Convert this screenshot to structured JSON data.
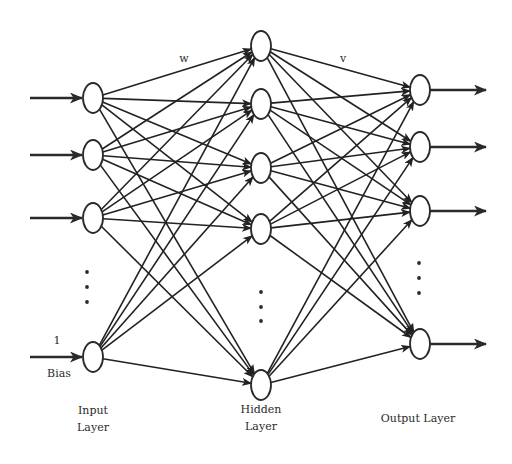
{
  "diagram": {
    "type": "feedforward-neural-network",
    "weight_labels": {
      "input_to_hidden": "w",
      "hidden_to_output": "v"
    },
    "bias": {
      "value_label": "1",
      "label": "Bias"
    },
    "layers": [
      {
        "name": "input",
        "label_line1": "Input",
        "label_line2": "Layer",
        "x": 93,
        "node_ys": [
          98,
          155,
          218,
          357
        ],
        "ellipsis_ys": [
          272,
          287,
          302
        ],
        "ellipsis_x": 87
      },
      {
        "name": "hidden",
        "label_line1": "Hidden",
        "label_line2": "Layer",
        "x": 261,
        "node_ys": [
          46,
          104,
          168,
          229,
          385
        ],
        "ellipsis_ys": [
          292,
          307,
          321
        ],
        "ellipsis_x": 261
      },
      {
        "name": "output",
        "label_line1": "Output Layer",
        "label_line2": "",
        "x": 420,
        "node_ys": [
          90,
          147,
          211,
          344
        ],
        "ellipsis_ys": [
          263,
          278,
          293
        ],
        "ellipsis_x": 419
      }
    ],
    "node_rx": 10,
    "node_ry": 15,
    "colors": {
      "stroke": "#2a2a2a",
      "background": "#ffffff"
    }
  }
}
